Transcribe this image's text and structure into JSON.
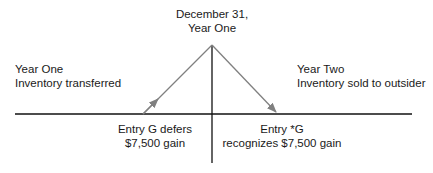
{
  "diagram": {
    "apex_label": [
      "December 31,",
      "Year One"
    ],
    "left_label": [
      "Year One",
      "Inventory transferred"
    ],
    "right_label": [
      "Year Two",
      "Inventory sold to outsider"
    ],
    "bottom_left_label": [
      "Entry G defers",
      "$7,500 gain"
    ],
    "bottom_right_label": [
      "Entry *G",
      "recognizes $7,500 gain"
    ],
    "colors": {
      "axis_line": "#111111",
      "arrow_line": "#808080",
      "text": "#1a1a1a"
    }
  }
}
